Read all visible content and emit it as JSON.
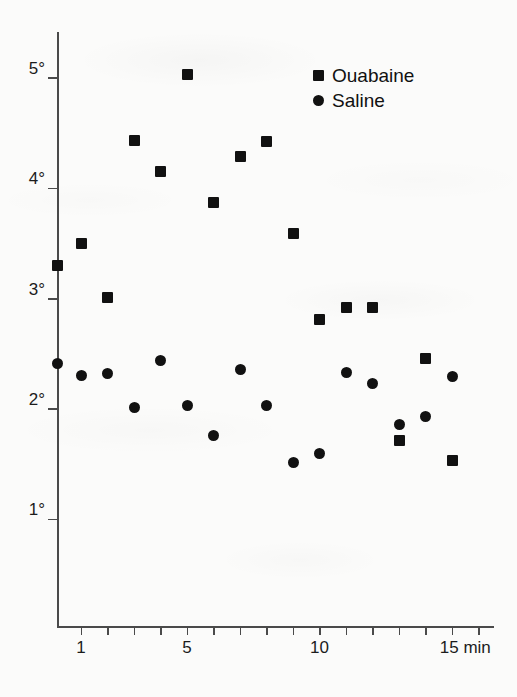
{
  "chart_data": {
    "type": "scatter",
    "title": "",
    "subtitle": "",
    "xlabel": "min",
    "ylabel": "",
    "xlim": [
      0,
      15.7
    ],
    "ylim": [
      0.35,
      5.35
    ],
    "grid": false,
    "legend_position": "top-right",
    "x_tick_labels": [
      {
        "value": 1,
        "label": "1"
      },
      {
        "value": 5,
        "label": "5"
      },
      {
        "value": 10,
        "label": "10"
      },
      {
        "value": 15,
        "label": "15 min"
      }
    ],
    "x_minor_ticks": [
      1,
      2,
      3,
      4,
      5,
      6,
      7,
      8,
      9,
      10,
      11,
      12,
      13,
      14,
      15,
      16
    ],
    "y_tick_labels": [
      {
        "value": 5,
        "label": "5°"
      },
      {
        "value": 4,
        "label": "4°"
      },
      {
        "value": 3,
        "label": "3°"
      },
      {
        "value": 2,
        "label": "2°"
      },
      {
        "value": 1,
        "label": "1°"
      }
    ],
    "series": [
      {
        "name": "Ouabaine",
        "marker": "square",
        "color": "#111111",
        "x": [
          0.1,
          1,
          2,
          3,
          4,
          5,
          6,
          7,
          8,
          9,
          10,
          11,
          12,
          13,
          14,
          15
        ],
        "y": [
          3.3,
          3.5,
          3.01,
          4.43,
          4.15,
          5.03,
          3.87,
          4.29,
          4.42,
          3.59,
          2.81,
          2.92,
          2.92,
          1.71,
          2.46,
          1.53
        ]
      },
      {
        "name": "Saline",
        "marker": "circle",
        "color": "#111111",
        "x": [
          0.1,
          1,
          2,
          3,
          4,
          5,
          6,
          7,
          8,
          9,
          10,
          11,
          12,
          13,
          14,
          15
        ],
        "y": [
          2.41,
          2.3,
          2.32,
          2.01,
          2.44,
          2.03,
          1.76,
          2.36,
          2.03,
          1.51,
          1.6,
          2.33,
          2.23,
          1.86,
          1.93,
          2.29
        ]
      }
    ]
  },
  "legend": {
    "entries": [
      {
        "label": "Ouabaine",
        "marker": "square"
      },
      {
        "label": "Saline",
        "marker": "circle"
      }
    ]
  },
  "axes": {
    "x_axis_name": "time-axis",
    "y_axis_name": "temperature-axis"
  }
}
